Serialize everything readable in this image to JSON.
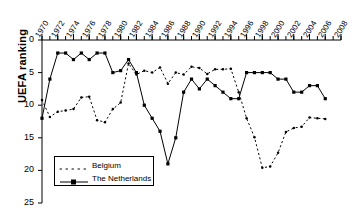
{
  "chart_data": {
    "type": "line",
    "title": "",
    "xlabel": "",
    "ylabel": "UEFA ranking",
    "xlim": [
      1970,
      2008
    ],
    "ylim": [
      0,
      25
    ],
    "y_inverted": true,
    "grid": false,
    "legend_position": "lower-left-inside",
    "y_ticks": [
      "0",
      "5",
      "10",
      "15",
      "20",
      "25"
    ],
    "y_tick_values": [
      0,
      5,
      10,
      15,
      20,
      25
    ],
    "x_ticks": [
      "1970",
      "1972",
      "1974",
      "1976",
      "1978",
      "1980",
      "1982",
      "1984",
      "1986",
      "1988",
      "1990",
      "1992",
      "1994",
      "1996",
      "1998",
      "2000",
      "2002",
      "2004",
      "2006",
      "2008"
    ],
    "x_tick_values": [
      1970,
      1972,
      1974,
      1976,
      1978,
      1980,
      1982,
      1984,
      1986,
      1988,
      1990,
      1992,
      1994,
      1996,
      1998,
      2000,
      2002,
      2004,
      2006,
      2008
    ],
    "x_minor_tick_step": 1,
    "series": [
      {
        "name": "Belgium",
        "style": "dotted",
        "marker": "dot",
        "color": "#000000",
        "x": [
          1970,
          1971,
          1972,
          1973,
          1974,
          1975,
          1976,
          1977,
          1978,
          1979,
          1980,
          1981,
          1982,
          1983,
          1984,
          1985,
          1986,
          1987,
          1988,
          1989,
          1990,
          1991,
          1992,
          1993,
          1994,
          1995,
          1996,
          1997,
          1998,
          1999,
          2000,
          2001,
          2002,
          2003,
          2004,
          2005,
          2006
        ],
        "y": [
          9.2,
          11.8,
          11.0,
          10.8,
          10.6,
          8.8,
          8.7,
          12.3,
          12.6,
          10.6,
          9.6,
          3.6,
          5.3,
          4.7,
          5.0,
          4.2,
          6.7,
          5.0,
          5.3,
          4.1,
          4.3,
          5.2,
          4.5,
          4.5,
          4.4,
          8.0,
          12.0,
          14.9,
          19.6,
          19.4,
          17.3,
          14.1,
          13.5,
          13.3,
          11.9,
          12.0,
          12.1
        ]
      },
      {
        "name": "The Netherlands",
        "style": "solid",
        "marker": "square",
        "color": "#000000",
        "x": [
          1970,
          1971,
          1972,
          1973,
          1974,
          1975,
          1976,
          1977,
          1978,
          1979,
          1980,
          1981,
          1982,
          1983,
          1984,
          1985,
          1986,
          1987,
          1988,
          1989,
          1990,
          1991,
          1992,
          1993,
          1994,
          1995,
          1996,
          1997,
          1998,
          1999,
          2000,
          2001,
          2002,
          2003,
          2004,
          2005,
          2006
        ],
        "y": [
          12.0,
          6.0,
          2.0,
          2.0,
          3.0,
          2.0,
          3.0,
          2.0,
          2.0,
          5.0,
          4.7,
          3.0,
          5.0,
          10.0,
          12.0,
          14.0,
          19.0,
          15.0,
          8.0,
          6.0,
          7.5,
          6.0,
          7.0,
          8.0,
          9.0,
          9.0,
          5.0,
          5.0,
          5.0,
          5.0,
          6.0,
          6.0,
          8.0,
          8.0,
          7.0,
          7.0,
          9.0
        ]
      }
    ]
  },
  "legend": {
    "entries": [
      {
        "label": "Belgium"
      },
      {
        "label": "The Netherlands"
      }
    ]
  },
  "axis": {
    "y_title": "UEFA ranking"
  }
}
